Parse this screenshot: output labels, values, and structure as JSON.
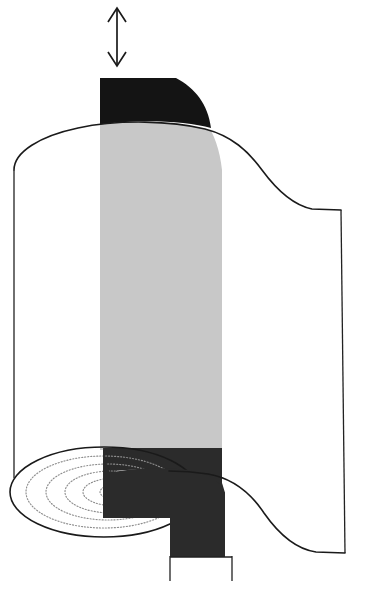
{
  "figure": {
    "title": "Rolled sheet / roll-up diagram",
    "type": "technical-line-diagram",
    "canvas": {
      "width": 370,
      "height": 615
    },
    "background_color": "#ffffff",
    "line_color": "#1a1a1a"
  },
  "palette": {
    "outline": "#1a1a1a",
    "gray_band": "#c8c8c8",
    "dark_band": "#2b2b2b",
    "black_cap": "#141414",
    "spiral_dotted": "#8d8d8d",
    "white": "#ffffff"
  },
  "annotations": {
    "motion_arrow": {
      "name": "vertical-double-headed-arrow",
      "label": "",
      "direction": "up-down",
      "x": 117,
      "y_top": 8,
      "y_bottom": 66,
      "head_half_width": 9,
      "head_length": 14
    }
  },
  "parts": [
    {
      "id": "top-cap",
      "name": "black-quarter-disc-cap",
      "fill": "#141414",
      "description": "Dark rounded cap above the top edge of the roll"
    },
    {
      "id": "roll-body",
      "name": "roll-body-outline",
      "fill": "#ffffff",
      "stroke": "#1a1a1a",
      "description": "Cylindrical rolled sheet with curved top edge and S-curved unrolled flap to the right"
    },
    {
      "id": "gray-stripe",
      "name": "gray-vertical-stripe",
      "fill": "#c8c8c8",
      "x_left": 100,
      "x_right": 222,
      "y_top": 128,
      "y_bottom": 450,
      "description": "Light gray band running down the visible face of the roll"
    },
    {
      "id": "dark-stripe",
      "name": "dark-band-lower",
      "fill": "#2b2b2b",
      "x_left": 103,
      "x_right": 225,
      "y_top": 448,
      "y_bottom": 557,
      "description": "Dark continuation of the stripe across the unrolled lower flap"
    },
    {
      "id": "roll-end-ellipse",
      "name": "roll-cross-section-ellipse",
      "center_x": 104,
      "center_y": 492,
      "radius_x": 94,
      "radius_y": 45,
      "description": "Elliptical end face of the roll at bottom left"
    },
    {
      "id": "spiral",
      "name": "dotted-spiral-cross-section",
      "turns": 5,
      "stroke": "#8d8d8d",
      "dash": "dotted",
      "description": "Concentric dotted spiral arcs showing the wound layers of the sheet"
    },
    {
      "id": "bottom-tab",
      "name": "bottom-tab-rectangle",
      "x_left": 170,
      "x_right": 232,
      "y_top": 556,
      "y_bottom": 581,
      "stroke": "#222222",
      "fill": "#ffffff",
      "description": "Small open-bottom rectangular tab under the dark band"
    }
  ],
  "spiral_arcs": [
    {
      "rx": 78,
      "ry": 36
    },
    {
      "rx": 62,
      "ry": 28
    },
    {
      "rx": 47,
      "ry": 21
    },
    {
      "rx": 33,
      "ry": 14
    },
    {
      "rx": 20,
      "ry": 8
    }
  ]
}
